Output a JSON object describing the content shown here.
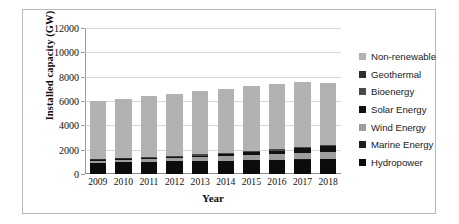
{
  "chart_data": {
    "type": "bar",
    "stacked": true,
    "title": "",
    "xlabel": "Year",
    "ylabel": "Installed capacity (GW)",
    "categories": [
      "2009",
      "2010",
      "2011",
      "2012",
      "2013",
      "2014",
      "2015",
      "2016",
      "2017",
      "2018"
    ],
    "ylim": [
      0,
      12000
    ],
    "yticks": [
      0,
      2000,
      4000,
      6000,
      8000,
      10000,
      12000
    ],
    "grid": true,
    "legend_position": "right",
    "series": [
      {
        "name": "Hydropower",
        "color": "#0c0c0c",
        "values": [
          935,
          970,
          1000,
          1040,
          1070,
          1105,
          1135,
          1160,
          1190,
          1215
        ]
      },
      {
        "name": "Marine Energy",
        "color": "#1f1f1f",
        "values": [
          5,
          5,
          5,
          5,
          5,
          5,
          5,
          5,
          5,
          5
        ]
      },
      {
        "name": "Wind Energy",
        "color": "#9d9d9d",
        "values": [
          160,
          180,
          220,
          270,
          300,
          350,
          420,
          470,
          515,
          565
        ]
      },
      {
        "name": "Solar Energy",
        "color": "#111111",
        "values": [
          25,
          40,
          70,
          100,
          140,
          180,
          225,
          300,
          390,
          490
        ]
      },
      {
        "name": "Bioenergy",
        "color": "#4a4a4a",
        "values": [
          70,
          80,
          85,
          90,
          95,
          100,
          105,
          110,
          115,
          120
        ]
      },
      {
        "name": "Geothermal",
        "color": "#2e2e2e",
        "values": [
          10,
          11,
          11,
          12,
          12,
          12,
          13,
          13,
          13,
          14
        ]
      },
      {
        "name": "Non-renewable",
        "color": "#b2b2b2",
        "values": [
          4795,
          4914,
          5009,
          5083,
          5178,
          5248,
          5297,
          5342,
          5372,
          5091
        ]
      }
    ],
    "totals": [
      6000,
      6200,
      6400,
      6600,
      6800,
      7000,
      7200,
      7400,
      7600,
      7500
    ],
    "legend_order": [
      "Non-renewable",
      "Geothermal",
      "Bioenergy",
      "Solar Energy",
      "Wind Energy",
      "Marine Energy",
      "Hydropower"
    ],
    "legend": [
      {
        "label": "Non-renewable",
        "color": "#b2b2b2"
      },
      {
        "label": "Geothermal",
        "color": "#2e2e2e"
      },
      {
        "label": "Bioenergy",
        "color": "#4a4a4a"
      },
      {
        "label": "Solar Energy",
        "color": "#111111"
      },
      {
        "label": "Wind Energy",
        "color": "#9d9d9d"
      },
      {
        "label": "Marine Energy",
        "color": "#1f1f1f"
      },
      {
        "label": "Hydropower",
        "color": "#0c0c0c"
      }
    ],
    "bar_totals_displayed": [
      6000,
      6300,
      6650,
      6950,
      7250,
      7600,
      8050,
      8450,
      8850,
      9500
    ]
  }
}
